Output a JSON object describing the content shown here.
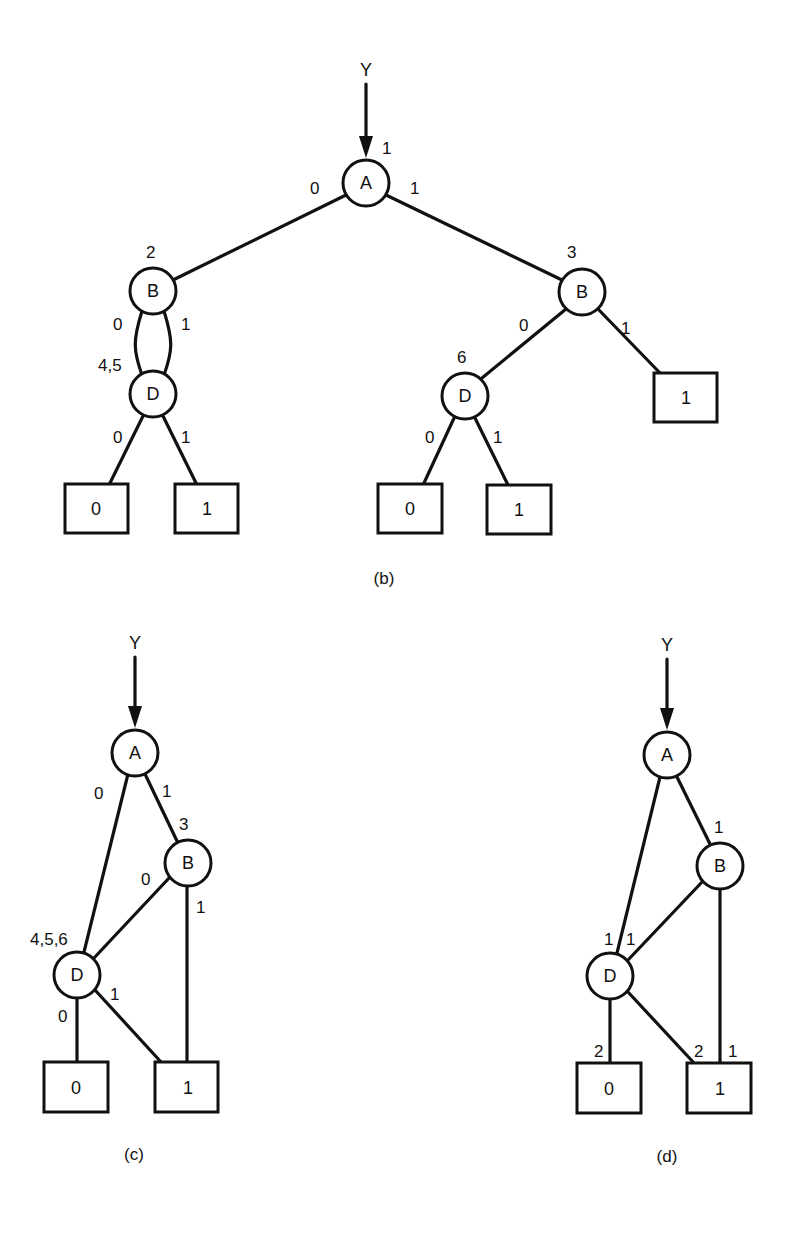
{
  "figures": {
    "b": {
      "caption": "(b)",
      "input_label": "Y",
      "root_weight": "1",
      "nodes": {
        "A": {
          "label": "A"
        },
        "B_left": {
          "label": "B",
          "id_label": "2"
        },
        "B_right": {
          "label": "B",
          "id_label": "3"
        },
        "D_left": {
          "label": "D",
          "id_label": "4,5"
        },
        "D_right": {
          "label": "D",
          "id_label": "6"
        }
      },
      "terminals": {
        "t_left_0": "0",
        "t_left_1": "1",
        "t_right_b1": "1",
        "t_right_0": "0",
        "t_right_1": "1"
      },
      "edge_labels": {
        "A_0": "0",
        "A_1": "1",
        "BL_0": "0",
        "BL_1": "1",
        "DL_0": "0",
        "DL_1": "1",
        "BR_0": "0",
        "BR_1": "1",
        "DR_0": "0",
        "DR_1": "1"
      }
    },
    "c": {
      "caption": "(c)",
      "input_label": "Y",
      "nodes": {
        "A": {
          "label": "A"
        },
        "B": {
          "label": "B",
          "id_label": "3"
        },
        "D": {
          "label": "D",
          "id_label": "4,5,6"
        }
      },
      "terminals": {
        "t0": "0",
        "t1": "1"
      },
      "edge_labels": {
        "A_0": "0",
        "A_1": "1",
        "B_0": "0",
        "B_1": "1",
        "D_0": "0",
        "D_1": "1"
      }
    },
    "d": {
      "caption": "(d)",
      "input_label": "Y",
      "nodes": {
        "A": {
          "label": "A"
        },
        "B": {
          "label": "B"
        },
        "D": {
          "label": "D"
        }
      },
      "terminals": {
        "t0": "0",
        "t1": "1"
      },
      "edge_weights": {
        "A_to_B": "1",
        "A_to_D": "1",
        "B_to_D": "1",
        "D_to_t0": "2",
        "D_to_t1": "2",
        "B_to_t1": "1"
      }
    }
  }
}
